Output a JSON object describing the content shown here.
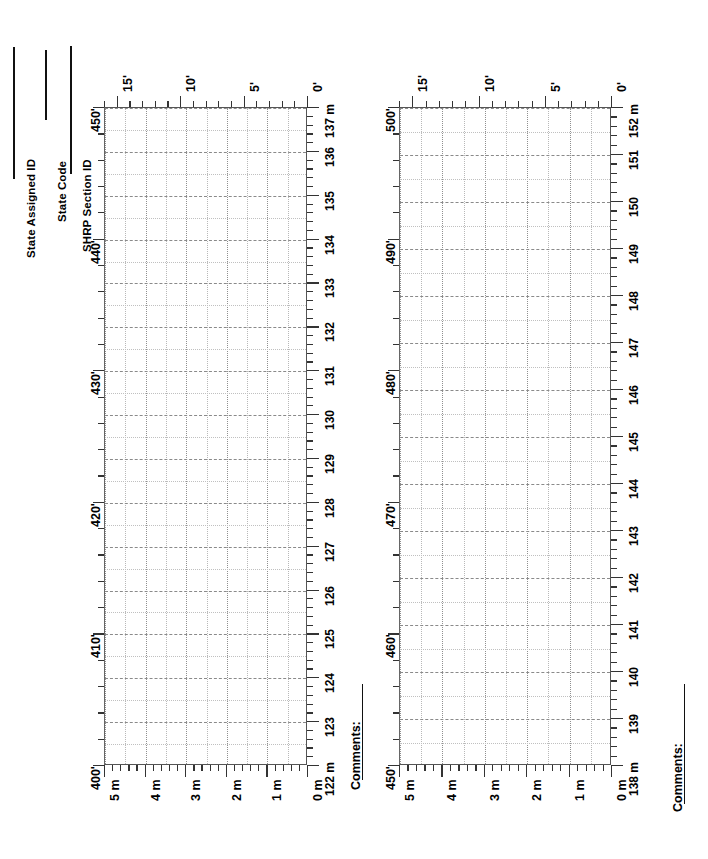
{
  "form": {
    "title": "Pavement Distress Survey Map",
    "header_fields": [
      {
        "label": "State Assigned ID",
        "value": ""
      },
      {
        "label": "State Code",
        "value": ""
      },
      {
        "label": "SHRP Section ID",
        "value": ""
      }
    ],
    "comments_label": "Comments:"
  },
  "chart_data": [
    {
      "id": "chart-1",
      "type": "grid-map",
      "title": "",
      "xlabel": "",
      "ylabel": "",
      "grid": true,
      "legend": "none",
      "axes": {
        "length_feet": {
          "name": "length-feet-axis",
          "unit": "ft",
          "position": "left",
          "range": [
            400,
            450
          ],
          "major_step": 10,
          "minor_step": 2,
          "tick_labels": [
            "400'",
            "410'",
            "420'",
            "430'",
            "440'",
            "450'"
          ],
          "tick_values": [
            400,
            410,
            420,
            430,
            440,
            450
          ]
        },
        "length_meters": {
          "name": "length-meters-axis",
          "unit": "m",
          "position": "right",
          "range": [
            122,
            137
          ],
          "major_step": 1,
          "minor_step": 0.2,
          "tick_labels": [
            "122 m",
            "123",
            "124",
            "125",
            "126",
            "127",
            "128",
            "129",
            "130",
            "131",
            "132",
            "133",
            "134",
            "135",
            "136",
            "137 m"
          ],
          "tick_values": [
            122,
            123,
            124,
            125,
            126,
            127,
            128,
            129,
            130,
            131,
            132,
            133,
            134,
            135,
            136,
            137
          ]
        },
        "width_feet": {
          "name": "width-feet-axis",
          "unit": "ft",
          "position": "top",
          "range": [
            0,
            16
          ],
          "major_step": 5,
          "minor_step": 1,
          "tick_labels": [
            "15'",
            "10'",
            "5'",
            "0'"
          ],
          "tick_values": [
            15,
            10,
            5,
            0
          ]
        },
        "width_meters": {
          "name": "width-meters-axis",
          "unit": "m",
          "position": "bottom",
          "range": [
            0,
            5
          ],
          "major_step": 1,
          "minor_step": 0.2,
          "tick_labels": [
            "5 m",
            "4 m",
            "3 m",
            "2 m",
            "1 m",
            "0 m"
          ],
          "tick_values": [
            5,
            4,
            3,
            2,
            1,
            0
          ]
        }
      },
      "series": [],
      "annotations": []
    },
    {
      "id": "chart-2",
      "type": "grid-map",
      "title": "",
      "xlabel": "",
      "ylabel": "",
      "grid": true,
      "legend": "none",
      "axes": {
        "length_feet": {
          "name": "length-feet-axis",
          "unit": "ft",
          "position": "left",
          "range": [
            450,
            500
          ],
          "major_step": 10,
          "minor_step": 2,
          "tick_labels": [
            "450'",
            "460'",
            "470'",
            "480'",
            "490'",
            "500'"
          ],
          "tick_values": [
            450,
            460,
            470,
            480,
            490,
            500
          ]
        },
        "length_meters": {
          "name": "length-meters-axis",
          "unit": "m",
          "position": "right",
          "range": [
            138,
            152
          ],
          "major_step": 1,
          "minor_step": 0.2,
          "tick_labels": [
            "138 m",
            "139",
            "140",
            "141",
            "142",
            "143",
            "144",
            "145",
            "146",
            "147",
            "148",
            "149",
            "150",
            "151",
            "152 m"
          ],
          "tick_values": [
            138,
            139,
            140,
            141,
            142,
            143,
            144,
            145,
            146,
            147,
            148,
            149,
            150,
            151,
            152
          ]
        },
        "width_feet": {
          "name": "width-feet-axis",
          "unit": "ft",
          "position": "top",
          "range": [
            0,
            16
          ],
          "major_step": 5,
          "minor_step": 1,
          "tick_labels": [
            "15'",
            "10'",
            "5'",
            "0'"
          ],
          "tick_values": [
            15,
            10,
            5,
            0
          ]
        },
        "width_meters": {
          "name": "width-meters-axis",
          "unit": "m",
          "position": "bottom",
          "range": [
            0,
            5
          ],
          "major_step": 1,
          "minor_step": 0.2,
          "tick_labels": [
            "5 m",
            "4 m",
            "3 m",
            "2 m",
            "1 m",
            "0 m"
          ],
          "tick_values": [
            5,
            4,
            3,
            2,
            1,
            0
          ]
        }
      },
      "series": [],
      "annotations": []
    }
  ],
  "colors": {
    "ink": "#111111",
    "frame": "#555555",
    "grid_minor": "#c0c0c0",
    "grid_major": "#8a8a8a",
    "paper": "#ffffff"
  }
}
